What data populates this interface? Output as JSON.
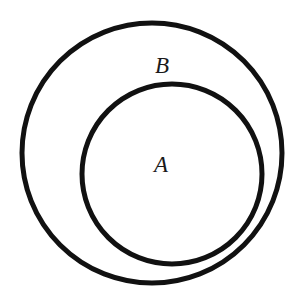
{
  "diagram": {
    "type": "venn-subset",
    "stroke_color": "#111111",
    "background": "#ffffff",
    "sets": [
      {
        "id": "B",
        "label": "B",
        "shape": "circle",
        "cx": 152,
        "cy": 153,
        "r": 130,
        "label_x": 162,
        "label_y": 73
      },
      {
        "id": "A",
        "label": "A",
        "shape": "circle",
        "cx": 172,
        "cy": 174,
        "r": 90,
        "label_x": 161,
        "label_y": 172
      }
    ]
  }
}
